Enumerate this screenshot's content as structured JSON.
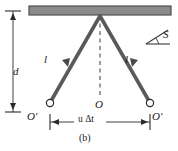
{
  "figure": {
    "caption": "(b)",
    "labels": {
      "height_d": "d",
      "rod_left": "l",
      "rod_right": "l",
      "origin_center": "O",
      "origin_left": "O′",
      "origin_right": "O′",
      "separation": "u Δt",
      "separation_u": "u",
      "separation_dt": "Δt",
      "frame": "S"
    },
    "colors": {
      "ceiling_fill": "#8a8a8a",
      "ceiling_stroke": "#4f4f4f",
      "rod": "#5a5a5a",
      "ink": "#1a1a1a",
      "background": "#ffffff"
    },
    "icons": {
      "ceiling": "ceiling-bar-icon",
      "rod_arrow": "rod-arrow-icon",
      "dimension_arrow_vertical": "vertical-dimension-arrow-icon",
      "dimension_arrow_horizontal": "horizontal-dimension-arrow-icon",
      "angle_mark": "angle-frame-icon",
      "pivot": "open-circle-icon"
    }
  }
}
